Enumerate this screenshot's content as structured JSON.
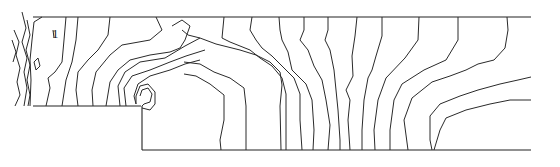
{
  "figure": {
    "type": "contour-diagram",
    "line_color": "#2a2a2a",
    "background": "#ffffff"
  },
  "domain": {
    "x_range": [
      0,
      560
    ],
    "y_range": [
      0,
      167
    ],
    "boundary": [
      {
        "name": "top-wall",
        "points": [
          [
            33,
            17
          ],
          [
            531,
            17
          ]
        ]
      },
      {
        "name": "step-upper-floor",
        "points": [
          [
            33,
            106
          ],
          [
            141,
            106
          ]
        ]
      },
      {
        "name": "step-riser",
        "points": [
          [
            142,
            106
          ],
          [
            142,
            150
          ]
        ]
      },
      {
        "name": "bottom-wall",
        "points": [
          [
            142,
            150
          ],
          [
            531,
            150
          ]
        ]
      }
    ]
  },
  "annotations": [
    {
      "text": "1",
      "x": 52,
      "y": 38
    }
  ],
  "contours": [
    [
      [
        14,
        30
      ],
      [
        19,
        42
      ],
      [
        16,
        55
      ],
      [
        20,
        68
      ],
      [
        17,
        82
      ],
      [
        20,
        95
      ],
      [
        15,
        106
      ]
    ],
    [
      [
        12,
        40
      ],
      [
        16,
        52
      ],
      [
        13,
        62
      ]
    ],
    [
      [
        22,
        12
      ],
      [
        26,
        28
      ],
      [
        22,
        42
      ],
      [
        27,
        58
      ],
      [
        24,
        72
      ],
      [
        27,
        88
      ],
      [
        24,
        106
      ]
    ],
    [
      [
        27,
        20
      ],
      [
        30,
        35
      ],
      [
        26,
        50
      ],
      [
        30,
        65
      ],
      [
        27,
        80
      ],
      [
        30,
        95
      ],
      [
        28,
        106
      ]
    ],
    [
      [
        34,
        62
      ],
      [
        38,
        58
      ],
      [
        40,
        66
      ],
      [
        36,
        70
      ],
      [
        34,
        62
      ]
    ],
    [
      [
        42,
        17
      ],
      [
        34,
        22
      ],
      [
        32,
        40
      ],
      [
        30,
        60
      ],
      [
        31,
        80
      ],
      [
        30,
        106
      ]
    ],
    [
      [
        53,
        30
      ],
      [
        54,
        38
      ]
    ],
    [
      [
        66,
        17
      ],
      [
        64,
        40
      ],
      [
        62,
        62
      ],
      [
        55,
        72
      ],
      [
        48,
        78
      ],
      [
        50,
        88
      ],
      [
        46,
        106
      ]
    ],
    [
      [
        78,
        17
      ],
      [
        76,
        40
      ],
      [
        72,
        62
      ],
      [
        66,
        80
      ],
      [
        62,
        106
      ]
    ],
    [
      [
        110,
        17
      ],
      [
        108,
        35
      ],
      [
        98,
        50
      ],
      [
        88,
        60
      ],
      [
        78,
        72
      ],
      [
        76,
        90
      ],
      [
        78,
        106
      ]
    ],
    [
      [
        156,
        17
      ],
      [
        162,
        30
      ],
      [
        150,
        40
      ],
      [
        122,
        45
      ],
      [
        110,
        55
      ],
      [
        96,
        72
      ],
      [
        92,
        90
      ],
      [
        93,
        106
      ]
    ],
    [
      [
        172,
        26
      ],
      [
        182,
        20
      ],
      [
        190,
        26
      ],
      [
        185,
        40
      ],
      [
        180,
        48
      ],
      [
        170,
        52
      ],
      [
        150,
        55
      ],
      [
        130,
        60
      ],
      [
        118,
        70
      ],
      [
        110,
        82
      ],
      [
        106,
        106
      ]
    ],
    [
      [
        200,
        38
      ],
      [
        185,
        46
      ],
      [
        165,
        58
      ],
      [
        140,
        62
      ],
      [
        125,
        72
      ],
      [
        118,
        86
      ],
      [
        120,
        106
      ]
    ],
    [
      [
        205,
        50
      ],
      [
        186,
        56
      ],
      [
        170,
        62
      ],
      [
        150,
        70
      ],
      [
        132,
        76
      ],
      [
        124,
        88
      ],
      [
        126,
        106
      ]
    ],
    [
      [
        200,
        60
      ],
      [
        185,
        64
      ],
      [
        170,
        70
      ],
      [
        150,
        76
      ],
      [
        138,
        84
      ],
      [
        134,
        96
      ],
      [
        136,
        104
      ]
    ],
    [
      [
        140,
        96
      ],
      [
        142,
        90
      ],
      [
        148,
        88
      ],
      [
        152,
        94
      ],
      [
        150,
        102
      ],
      [
        144,
        104
      ],
      [
        142,
        106
      ]
    ],
    [
      [
        142,
        108
      ],
      [
        150,
        110
      ],
      [
        155,
        104
      ],
      [
        155,
        92
      ],
      [
        148,
        84
      ],
      [
        140,
        86
      ],
      [
        136,
        96
      ],
      [
        136,
        104
      ]
    ],
    [
      [
        182,
        30
      ],
      [
        188,
        35
      ],
      [
        200,
        38
      ],
      [
        216,
        44
      ],
      [
        240,
        50
      ],
      [
        256,
        55
      ],
      [
        270,
        62
      ],
      [
        280,
        72
      ],
      [
        282,
        85
      ],
      [
        280,
        106
      ],
      [
        281,
        150
      ]
    ],
    [
      [
        184,
        62
      ],
      [
        200,
        64
      ],
      [
        214,
        72
      ],
      [
        230,
        78
      ],
      [
        244,
        88
      ],
      [
        246,
        106
      ],
      [
        246,
        150
      ]
    ],
    [
      [
        184,
        74
      ],
      [
        196,
        76
      ],
      [
        210,
        84
      ],
      [
        224,
        95
      ],
      [
        224,
        120
      ],
      [
        220,
        140
      ],
      [
        221,
        150
      ]
    ],
    [
      [
        224,
        17
      ],
      [
        222,
        38
      ],
      [
        230,
        42
      ],
      [
        250,
        50
      ],
      [
        260,
        58
      ],
      [
        272,
        66
      ],
      [
        282,
        78
      ],
      [
        286,
        94
      ],
      [
        286,
        120
      ],
      [
        286,
        150
      ]
    ],
    [
      [
        252,
        17
      ],
      [
        250,
        30
      ],
      [
        256,
        40
      ],
      [
        262,
        48
      ],
      [
        272,
        56
      ],
      [
        280,
        64
      ],
      [
        294,
        78
      ],
      [
        300,
        94
      ],
      [
        300,
        120
      ],
      [
        302,
        150
      ]
    ],
    [
      [
        279,
        17
      ],
      [
        280,
        30
      ],
      [
        282,
        40
      ],
      [
        288,
        52
      ],
      [
        292,
        70
      ],
      [
        306,
        84
      ],
      [
        312,
        100
      ],
      [
        314,
        130
      ],
      [
        313,
        150
      ]
    ],
    [
      [
        304,
        17
      ],
      [
        304,
        30
      ],
      [
        300,
        40
      ],
      [
        308,
        50
      ],
      [
        314,
        66
      ],
      [
        322,
        80
      ],
      [
        326,
        100
      ],
      [
        330,
        125
      ],
      [
        328,
        150
      ]
    ],
    [
      [
        328,
        17
      ],
      [
        328,
        30
      ],
      [
        325,
        40
      ],
      [
        330,
        50
      ],
      [
        334,
        70
      ],
      [
        336,
        90
      ],
      [
        338,
        110
      ],
      [
        340,
        140
      ],
      [
        340,
        150
      ]
    ],
    [
      [
        357,
        17
      ],
      [
        355,
        36
      ],
      [
        352,
        56
      ],
      [
        353,
        76
      ],
      [
        346,
        90
      ],
      [
        350,
        100
      ],
      [
        348,
        120
      ],
      [
        350,
        150
      ]
    ],
    [
      [
        382,
        17
      ],
      [
        382,
        36
      ],
      [
        376,
        56
      ],
      [
        372,
        70
      ],
      [
        368,
        78
      ],
      [
        364,
        100
      ],
      [
        362,
        130
      ],
      [
        362,
        150
      ]
    ],
    [
      [
        419,
        17
      ],
      [
        418,
        40
      ],
      [
        405,
        58
      ],
      [
        386,
        78
      ],
      [
        378,
        100
      ],
      [
        374,
        130
      ],
      [
        375,
        150
      ]
    ],
    [
      [
        458,
        17
      ],
      [
        458,
        40
      ],
      [
        446,
        60
      ],
      [
        424,
        70
      ],
      [
        402,
        84
      ],
      [
        394,
        100
      ],
      [
        390,
        130
      ],
      [
        390,
        150
      ]
    ],
    [
      [
        507,
        17
      ],
      [
        508,
        30
      ],
      [
        505,
        48
      ],
      [
        494,
        60
      ],
      [
        478,
        64
      ],
      [
        466,
        70
      ],
      [
        450,
        76
      ],
      [
        432,
        82
      ],
      [
        412,
        98
      ],
      [
        404,
        120
      ],
      [
        408,
        150
      ]
    ],
    [
      [
        531,
        77
      ],
      [
        518,
        80
      ],
      [
        500,
        84
      ],
      [
        478,
        90
      ],
      [
        460,
        96
      ],
      [
        440,
        104
      ],
      [
        430,
        116
      ],
      [
        430,
        140
      ],
      [
        432,
        150
      ]
    ],
    [
      [
        531,
        100
      ],
      [
        510,
        100
      ],
      [
        490,
        104
      ],
      [
        466,
        110
      ],
      [
        446,
        118
      ],
      [
        440,
        130
      ],
      [
        434,
        150
      ]
    ]
  ]
}
